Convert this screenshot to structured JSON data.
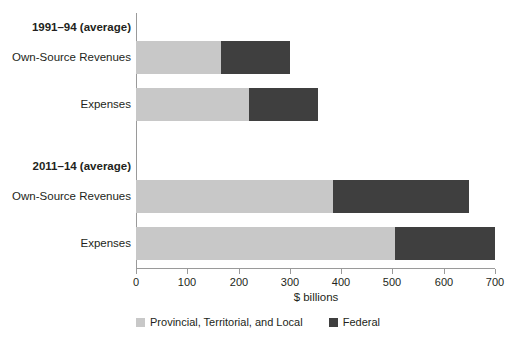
{
  "chart_data": {
    "type": "bar",
    "orientation": "horizontal",
    "stacked": true,
    "title": "",
    "xlabel": "$ billions",
    "ylabel": "",
    "xlim": [
      0,
      700
    ],
    "xticks": [
      0,
      100,
      200,
      300,
      400,
      500,
      600,
      700
    ],
    "xtick_labels": [
      "0",
      "100",
      "200",
      "300",
      "400",
      "500",
      "600",
      "700"
    ],
    "grid": false,
    "legend_position": "bottom",
    "groups": [
      {
        "label": "1991–94 (average)",
        "categories": [
          "Own-Source Revenues",
          "Expenses"
        ]
      },
      {
        "label": "2011–14 (average)",
        "categories": [
          "Own-Source Revenues",
          "Expenses"
        ]
      }
    ],
    "categories": [
      "1991–94 (average) – Own-Source Revenues",
      "1991–94 (average) – Expenses",
      "2011–14 (average) – Own-Source Revenues",
      "2011–14 (average) – Expenses"
    ],
    "series": [
      {
        "name": "Provincial, Territorial, and Local",
        "color": "#c8c8c8",
        "values": [
          165,
          220,
          385,
          505
        ]
      },
      {
        "name": "Federal",
        "color": "#3f3f3f",
        "values": [
          135,
          135,
          265,
          195
        ]
      }
    ],
    "totals": [
      300,
      355,
      650,
      700
    ]
  },
  "labels": {
    "group_1991": "1991–94 (average)",
    "group_2011": "2011–14 (average)",
    "own_source_revenues": "Own-Source Revenues",
    "expenses": "Expenses",
    "axis_title": "$ billions"
  },
  "ticks": {
    "t0": "0",
    "t100": "100",
    "t200": "200",
    "t300": "300",
    "t400": "400",
    "t500": "500",
    "t600": "600",
    "t700": "700"
  },
  "legend": {
    "items": [
      {
        "label": "Provincial, Territorial, and Local",
        "color": "#c8c8c8"
      },
      {
        "label": "Federal",
        "color": "#3f3f3f"
      }
    ]
  },
  "colors": {
    "provincial": "#c8c8c8",
    "federal": "#3f3f3f",
    "axis": "#9a9a9a",
    "text": "#231f20",
    "background": "#ffffff"
  }
}
